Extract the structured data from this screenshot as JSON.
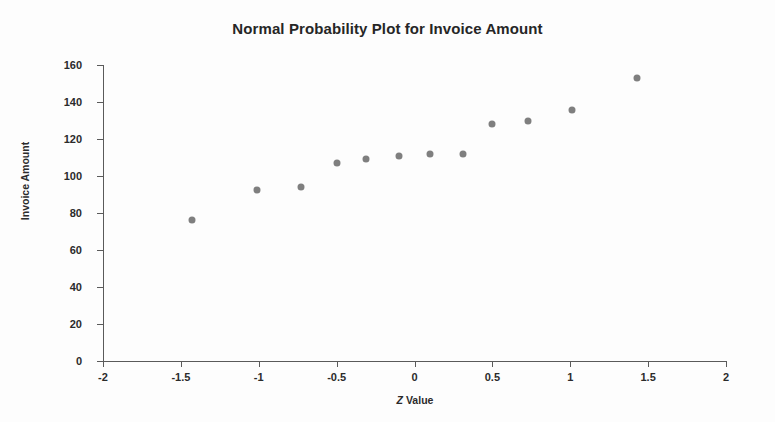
{
  "chart_data": {
    "type": "scatter",
    "title": "Normal Probability Plot for Invoice Amount",
    "xlabel_prefix": "Z",
    "xlabel_suffix": " Value",
    "xlabel": "Z Value",
    "ylabel": "Invoice Amount",
    "xlim": [
      -2,
      2
    ],
    "ylim": [
      0,
      160
    ],
    "xticks": [
      -2,
      -1.5,
      -1,
      -0.5,
      0,
      0.5,
      1,
      1.5,
      2
    ],
    "xtick_labels": [
      "-2",
      "-1.5",
      "-1",
      "-0.5",
      "0",
      "0.5",
      "1",
      "1.5",
      "2"
    ],
    "yticks": [
      0,
      20,
      40,
      60,
      80,
      100,
      120,
      140,
      160
    ],
    "ytick_labels": [
      "0",
      "20",
      "40",
      "60",
      "80",
      "100",
      "120",
      "140",
      "160"
    ],
    "grid": false,
    "legend": false,
    "marker_color": "#7f7f7f",
    "marker_size": 7,
    "x": [
      -1.43,
      -1.01,
      -0.73,
      -0.5,
      -0.31,
      -0.1,
      0.1,
      0.31,
      0.5,
      0.73,
      1.01,
      1.43
    ],
    "y": [
      76,
      92.5,
      94,
      107,
      109,
      111,
      112,
      112,
      128,
      129.5,
      135.5,
      153
    ],
    "points": [
      {
        "x": -1.43,
        "y": 76
      },
      {
        "x": -1.01,
        "y": 92.5
      },
      {
        "x": -0.73,
        "y": 94
      },
      {
        "x": -0.5,
        "y": 107
      },
      {
        "x": -0.31,
        "y": 109
      },
      {
        "x": -0.1,
        "y": 111
      },
      {
        "x": 0.1,
        "y": 112
      },
      {
        "x": 0.31,
        "y": 112
      },
      {
        "x": 0.5,
        "y": 128
      },
      {
        "x": 0.73,
        "y": 129.5
      },
      {
        "x": 1.01,
        "y": 135.5
      },
      {
        "x": 1.43,
        "y": 153
      }
    ]
  }
}
